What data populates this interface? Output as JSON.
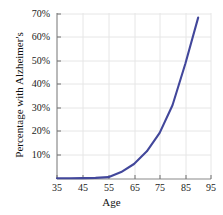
{
  "chart_data": {
    "type": "line",
    "title": "",
    "subtitle": "",
    "xlabel": "Age",
    "ylabel": "Percentage with Alzheimer's",
    "xlim": [
      35,
      95
    ],
    "ylim": [
      0,
      72
    ],
    "xticks": [
      35,
      45,
      55,
      65,
      75,
      85,
      95
    ],
    "xtick_labels": [
      "35",
      "45",
      "55",
      "65",
      "75",
      "85",
      "95"
    ],
    "yticks": [
      10,
      20,
      30,
      40,
      50,
      60,
      70
    ],
    "ytick_labels": [
      "10%",
      "20%",
      "30%",
      "40%",
      "50%",
      "60%",
      "70%"
    ],
    "grid": true,
    "legend": false,
    "legend_position": "none",
    "series": [
      {
        "name": "Percentage with Alzheimer's",
        "color": "#42479b",
        "line_width": 2.1,
        "x": [
          35,
          40,
          45,
          50,
          55,
          60,
          65,
          70,
          75,
          80,
          85,
          90
        ],
        "values": [
          0.3,
          0.3,
          0.4,
          0.5,
          0.8,
          3.0,
          6.5,
          12.0,
          20.0,
          32.0,
          50.0,
          70.0
        ]
      }
    ],
    "annotations": []
  },
  "axes": {
    "frame_color": "#8a8a8a",
    "grid_color": "#e6e6e6",
    "background": "#ffffff",
    "tick_color": "#6f6f6f"
  }
}
